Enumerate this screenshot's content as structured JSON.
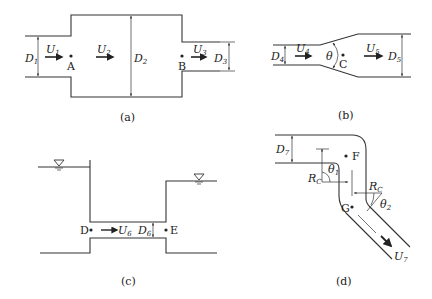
{
  "figure": {
    "panels": [
      {
        "id": "a",
        "caption": "(a)",
        "description": "Sudden expansion followed by sudden contraction",
        "labels": {
          "D1": {
            "main": "D",
            "sub": "1"
          },
          "U1": {
            "main": "U",
            "sub": "1"
          },
          "A": "A",
          "U2": {
            "main": "U",
            "sub": "2"
          },
          "D2": {
            "main": "D",
            "sub": "2"
          },
          "B": "B",
          "U3": {
            "main": "U",
            "sub": "3"
          },
          "D3": {
            "main": "D",
            "sub": "3"
          }
        }
      },
      {
        "id": "b",
        "caption": "(b)",
        "description": "Gradual expansion (diffuser) with cone angle",
        "labels": {
          "D4": {
            "main": "D",
            "sub": "4"
          },
          "U4": {
            "main": "U",
            "sub": "4"
          },
          "theta": "θ",
          "C": "C",
          "U5": {
            "main": "U",
            "sub": "5"
          },
          "D5": {
            "main": "D",
            "sub": "5"
          }
        }
      },
      {
        "id": "c",
        "caption": "(c)",
        "description": "Pipe connecting two reservoirs",
        "labels": {
          "D": "D",
          "U6": {
            "main": "U",
            "sub": "6"
          },
          "D6": {
            "main": "D",
            "sub": "6"
          },
          "E": "E",
          "water_surface_symbol": "▽"
        }
      },
      {
        "id": "d",
        "caption": "(d)",
        "description": "Pipe bends with radius of curvature",
        "labels": {
          "D7": {
            "main": "D",
            "sub": "7"
          },
          "F": "F",
          "Rc1": {
            "main": "R",
            "sub": "C"
          },
          "theta1": {
            "main": "θ",
            "sub": "1"
          },
          "Rc2": {
            "main": "R",
            "sub": "C"
          },
          "theta2": {
            "main": "θ",
            "sub": "2"
          },
          "G": "G",
          "U7": {
            "main": "U",
            "sub": "7"
          }
        }
      }
    ],
    "colors": {
      "line": "#333333",
      "text": "#222222",
      "background": "#ffffff"
    }
  }
}
